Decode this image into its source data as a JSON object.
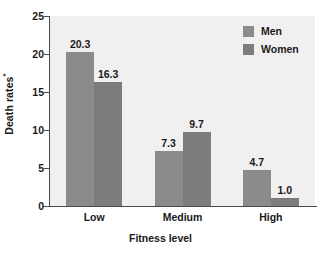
{
  "chart_data": {
    "type": "bar",
    "title": "",
    "subtitle": "",
    "xlabel": "Fitness level",
    "ylabel": "Death rates*",
    "ylabel_text": "Death rates",
    "ylabel_footnote_marker": "*",
    "categories": [
      "Low",
      "Medium",
      "High"
    ],
    "series": [
      {
        "name": "Men",
        "values": [
          20.3,
          7.3,
          4.7
        ],
        "color": "#8b8b8b"
      },
      {
        "name": "Women",
        "values": [
          16.3,
          9.7,
          1.0
        ],
        "color": "#7c7c7c"
      }
    ],
    "value_labels": [
      [
        "20.3",
        "16.3"
      ],
      [
        "7.3",
        "9.7"
      ],
      [
        "4.7",
        "1.0"
      ]
    ],
    "ylim": [
      0,
      25
    ],
    "yticks": [
      0,
      5,
      10,
      15,
      20,
      25
    ],
    "ytick_labels": [
      "0",
      "5",
      "10",
      "15",
      "20",
      "25"
    ],
    "grid": false,
    "legend_position": "top-right",
    "legend_entries": [
      "Men",
      "Women"
    ],
    "plot_background": "#f1efef",
    "figure_background": "#ffffff",
    "axis_color": "#4a4a4a"
  }
}
